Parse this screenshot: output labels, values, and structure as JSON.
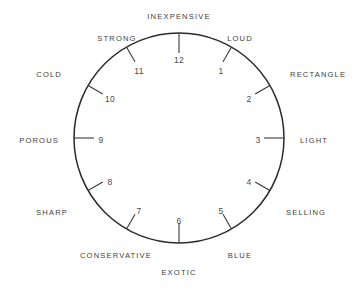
{
  "figure": {
    "title": "",
    "background_color": "#ffffff",
    "line_color": "#2b2b2b",
    "text_color": "#3d3d3d"
  },
  "chart_data": {
    "type": "scatter",
    "title": "",
    "xlabel": "",
    "ylabel": "",
    "center": {
      "x": 179,
      "y": 138
    },
    "radius": 105,
    "grid": false,
    "legend": null,
    "categories": [
      "12",
      "1",
      "2",
      "3",
      "4",
      "5",
      "6",
      "7",
      "8",
      "9",
      "10",
      "11"
    ],
    "values": [
      12,
      1,
      2,
      3,
      4,
      5,
      6,
      7,
      8,
      9,
      10,
      11
    ],
    "points": [
      {
        "hour": "12",
        "angle_deg": 0,
        "label": "INEXPENSIVE",
        "num_x": 179,
        "num_y": 61,
        "label_x": 179,
        "label_y": 17,
        "label_anchor": "middle",
        "tick_inner_r": 85,
        "tick_outer_r": 105,
        "tick_radial": true
      },
      {
        "hour": "1",
        "angle_deg": 30,
        "label": "LOUD",
        "num_x": 221,
        "num_y": 72,
        "label_x": 240,
        "label_y": 39,
        "label_anchor": "middle",
        "tick_inner_r": 88,
        "tick_outer_r": 105,
        "tick_radial": false
      },
      {
        "hour": "2",
        "angle_deg": 60,
        "label": "RECTANGLE",
        "num_x": 249,
        "num_y": 100,
        "label_x": 290,
        "label_y": 75,
        "label_anchor": "start",
        "tick_inner_r": 88,
        "tick_outer_r": 105,
        "tick_radial": false
      },
      {
        "hour": "3",
        "angle_deg": 90,
        "label": "LIGHT",
        "num_x": 258,
        "num_y": 141,
        "label_x": 300,
        "label_y": 141,
        "label_anchor": "start",
        "tick_inner_r": 85,
        "tick_outer_r": 105,
        "tick_radial": true
      },
      {
        "hour": "4",
        "angle_deg": 120,
        "label": "SELLING",
        "num_x": 249,
        "num_y": 183,
        "label_x": 286,
        "label_y": 213,
        "label_anchor": "start",
        "tick_inner_r": 88,
        "tick_outer_r": 105,
        "tick_radial": false
      },
      {
        "hour": "5",
        "angle_deg": 150,
        "label": "BLUE",
        "num_x": 221,
        "num_y": 212,
        "label_x": 240,
        "label_y": 256,
        "label_anchor": "middle",
        "tick_inner_r": 88,
        "tick_outer_r": 105,
        "tick_radial": false
      },
      {
        "hour": "6",
        "angle_deg": 180,
        "label": "EXOTIC",
        "num_x": 179,
        "num_y": 222,
        "label_x": 179,
        "label_y": 273,
        "label_anchor": "middle",
        "tick_inner_r": 85,
        "tick_outer_r": 105,
        "tick_radial": true
      },
      {
        "hour": "7",
        "angle_deg": 210,
        "label": "CONSERVATIVE",
        "num_x": 139,
        "num_y": 212,
        "label_x": 116,
        "label_y": 256,
        "label_anchor": "middle",
        "tick_inner_r": 88,
        "tick_outer_r": 105,
        "tick_radial": false
      },
      {
        "hour": "8",
        "angle_deg": 240,
        "label": "SHARP",
        "num_x": 110,
        "num_y": 183,
        "label_x": 68,
        "label_y": 213,
        "label_anchor": "end",
        "tick_inner_r": 88,
        "tick_outer_r": 105,
        "tick_radial": false
      },
      {
        "hour": "9",
        "angle_deg": 270,
        "label": "POROUS",
        "num_x": 101,
        "num_y": 141,
        "label_x": 59,
        "label_y": 141,
        "label_anchor": "end",
        "tick_inner_r": 85,
        "tick_outer_r": 105,
        "tick_radial": true
      },
      {
        "hour": "10",
        "angle_deg": 300,
        "label": "COLD",
        "num_x": 110,
        "num_y": 100,
        "label_x": 62,
        "label_y": 75,
        "label_anchor": "end",
        "tick_inner_r": 88,
        "tick_outer_r": 105,
        "tick_radial": false
      },
      {
        "hour": "11",
        "angle_deg": 330,
        "label": "STRONG",
        "num_x": 139,
        "num_y": 72,
        "label_x": 117,
        "label_y": 39,
        "label_anchor": "middle",
        "tick_inner_r": 88,
        "tick_outer_r": 105,
        "tick_radial": false
      }
    ]
  }
}
